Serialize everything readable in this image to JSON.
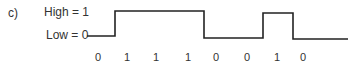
{
  "figure": {
    "panel_label": "c)",
    "levels": {
      "high": "High = 1",
      "low": "Low = 0"
    },
    "bits": [
      "0",
      "1",
      "1",
      "1",
      "0",
      "0",
      "1",
      "0"
    ],
    "line_color": "#222222"
  }
}
